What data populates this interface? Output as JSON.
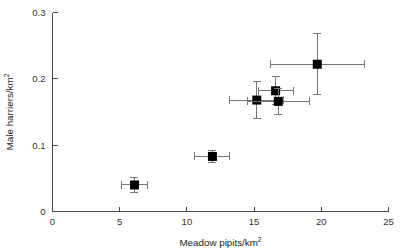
{
  "figure": {
    "background_color": "#ffffff",
    "marker_color": "#000000",
    "errorbar_color": "#777777",
    "axis_color": "#4a4a4a"
  },
  "chart_data": {
    "type": "scatter",
    "title": "",
    "xlabel": "Meadow pipits/km",
    "xlabel_sup": "2",
    "ylabel": "Male harriers/km",
    "ylabel_sup": "2",
    "xlim": [
      0,
      25
    ],
    "ylim": [
      0,
      0.3
    ],
    "xticks": [
      0,
      5,
      10,
      15,
      20,
      25
    ],
    "xtick_labels": [
      "0",
      "5",
      "10",
      "15",
      "20",
      "25"
    ],
    "yticks": [
      0,
      0.1,
      0.2,
      0.3
    ],
    "ytick_labels": [
      "0",
      "0.1",
      "0.2",
      "0.3"
    ],
    "grid": false,
    "legend": null,
    "marker_style": "filled-square",
    "error_bars": "both-x-and-y",
    "points": [
      {
        "x": 6.1,
        "y": 0.04,
        "xerr": 1.0,
        "yerr": 0.011
      },
      {
        "x": 11.9,
        "y": 0.083,
        "xerr": 1.3,
        "yerr": 0.009
      },
      {
        "x": 15.2,
        "y": 0.168,
        "xerr": 2.0,
        "yerr": 0.028
      },
      {
        "x": 16.6,
        "y": 0.182,
        "xerr": 1.3,
        "yerr": 0.021
      },
      {
        "x": 16.8,
        "y": 0.166,
        "xerr": 2.3,
        "yerr": 0.02
      },
      {
        "x": 19.7,
        "y": 0.222,
        "xerr": 3.5,
        "yerr": 0.046
      }
    ]
  }
}
